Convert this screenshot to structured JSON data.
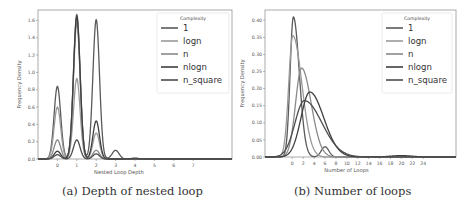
{
  "chart_data": [
    {
      "type": "line",
      "subtype": "kde-density",
      "caption": "(a) Depth of nested loop",
      "xlabel": "Nested Loop Depth",
      "ylabel": "Frequency Density",
      "x_ticks": [
        "0",
        "1",
        "2",
        "3",
        "4",
        "5",
        "6",
        "7"
      ],
      "y_ticks": [
        "0.0",
        "0.2",
        "0.4",
        "0.6",
        "0.8",
        "1.0",
        "1.2",
        "1.4",
        "1.6"
      ],
      "xlim": [
        -1.0,
        9.0
      ],
      "ylim": [
        0.0,
        1.72
      ],
      "grid": false,
      "legend": {
        "title": "Complexity",
        "position": "upper right",
        "entries": [
          "1",
          "logn",
          "n",
          "nlogn",
          "n_square"
        ]
      },
      "series": [
        {
          "name": "1",
          "color": "#5a5a5a",
          "peaks": [
            {
              "x": 0,
              "y": 0.84
            },
            {
              "x": 1,
              "y": 1.67
            },
            {
              "x": 2,
              "y": 1.61
            },
            {
              "x": 3,
              "y": 0.1
            }
          ]
        },
        {
          "name": "logn",
          "color": "#9a9a9a",
          "peaks": [
            {
              "x": 0,
              "y": 0.6
            },
            {
              "x": 1,
              "y": 0.93
            },
            {
              "x": 2,
              "y": 0.3
            }
          ]
        },
        {
          "name": "n",
          "color": "#8a8a8a",
          "peaks": [
            {
              "x": 0,
              "y": 0.22
            },
            {
              "x": 1,
              "y": 1.57
            },
            {
              "x": 2,
              "y": 0.1
            }
          ]
        },
        {
          "name": "nlogn",
          "color": "#3f3f3f",
          "peaks": [
            {
              "x": 0,
              "y": 0.09
            },
            {
              "x": 1,
              "y": 1.64
            },
            {
              "x": 2,
              "y": 0.44
            },
            {
              "x": 4,
              "y": 0.01
            }
          ]
        },
        {
          "name": "n_square",
          "color": "#4d4d4d",
          "peaks": [
            {
              "x": 0,
              "y": 0.05
            },
            {
              "x": 1,
              "y": 0.22
            },
            {
              "x": 2,
              "y": 0.06
            }
          ]
        }
      ]
    },
    {
      "type": "line",
      "subtype": "kde-density",
      "caption": "(b) Number of loops",
      "xlabel": "Number of Loops",
      "ylabel": "Frequency Density",
      "x_ticks": [
        "0",
        "2",
        "4",
        "6",
        "8",
        "10",
        "12",
        "14",
        "16",
        "18",
        "20",
        "22",
        "24"
      ],
      "y_ticks": [
        "0.00",
        "0.05",
        "0.10",
        "0.15",
        "0.20",
        "0.25",
        "0.30",
        "0.35",
        "0.40"
      ],
      "xlim": [
        -5.0,
        30.0
      ],
      "ylim": [
        0.0,
        0.43
      ],
      "grid": false,
      "legend": {
        "title": "Complexity",
        "position": "upper right",
        "entries": [
          "1",
          "logn",
          "n",
          "nlogn",
          "n_square"
        ]
      },
      "series": [
        {
          "name": "1",
          "color": "#5a5a5a",
          "peaks": [
            {
              "x": 0.2,
              "y": 0.41
            },
            {
              "x": 6,
              "y": 0.03
            }
          ]
        },
        {
          "name": "logn",
          "color": "#9a9a9a",
          "peaks": [
            {
              "x": 0.1,
              "y": 0.355
            }
          ]
        },
        {
          "name": "n",
          "color": "#8a8a8a",
          "peaks": [
            {
              "x": 1.7,
              "y": 0.26
            }
          ]
        },
        {
          "name": "nlogn",
          "color": "#3f3f3f",
          "peaks": [
            {
              "x": 3.2,
              "y": 0.19
            },
            {
              "x": 20,
              "y": 0.004
            }
          ]
        },
        {
          "name": "n_square",
          "color": "#4d4d4d",
          "peaks": [
            {
              "x": 2.2,
              "y": 0.165
            }
          ]
        }
      ]
    }
  ],
  "captions": {
    "a": "(a) Depth of nested loop",
    "b": "(b) Number of loops"
  },
  "axes": {
    "a": {
      "xlabel": "Nested Loop Depth",
      "ylabel": "Frequency Density"
    },
    "b": {
      "xlabel": "Number of Loops",
      "ylabel": "Frequency Density"
    }
  },
  "legend": {
    "title": "Complexity",
    "entries": [
      "1",
      "logn",
      "n",
      "nlogn",
      "n_square"
    ],
    "colors": [
      "#5a5a5a",
      "#9a9a9a",
      "#8a8a8a",
      "#3f3f3f",
      "#4d4d4d"
    ]
  }
}
